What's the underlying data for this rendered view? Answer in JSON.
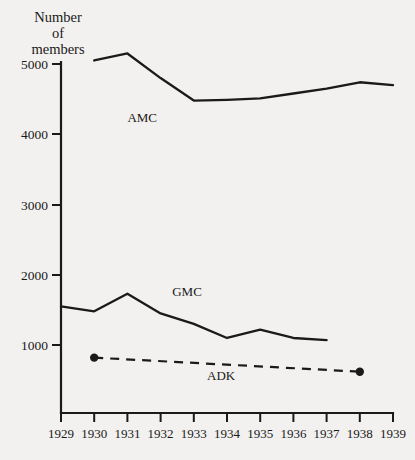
{
  "chart_data": {
    "type": "line",
    "title": "",
    "ylabel": "Number of members",
    "ylabel_lines": [
      "Number",
      "of",
      "members"
    ],
    "xlabel": "",
    "x": [
      1929,
      1930,
      1931,
      1932,
      1933,
      1934,
      1935,
      1936,
      1937,
      1938,
      1939
    ],
    "xtick_labels": [
      "1929",
      "1930",
      "1931",
      "1932",
      "1933",
      "1934",
      "1935",
      "1936",
      "1937",
      "1938",
      "1939"
    ],
    "ytick_labels": [
      "1000",
      "2000",
      "3000",
      "4000",
      "5000"
    ],
    "yticks": [
      1000,
      2000,
      3000,
      4000,
      5000
    ],
    "xlim": [
      1929,
      1939
    ],
    "ylim": [
      0,
      5000
    ],
    "grid": false,
    "legend_position": "inline-labels",
    "series": [
      {
        "name": "AMC",
        "label": "AMC",
        "style": "solid",
        "markers": false,
        "x": [
          1930,
          1931,
          1932,
          1933,
          1934,
          1935,
          1936,
          1937,
          1938,
          1939
        ],
        "values": [
          5050,
          5150,
          4800,
          4480,
          4490,
          4510,
          4580,
          4650,
          4740,
          4700
        ]
      },
      {
        "name": "GMC",
        "label": "GMC",
        "style": "solid",
        "markers": false,
        "x": [
          1929,
          1930,
          1931,
          1932,
          1933,
          1934,
          1935,
          1936,
          1937
        ],
        "values": [
          1550,
          1480,
          1730,
          1450,
          1300,
          1100,
          1220,
          1100,
          1070
        ]
      },
      {
        "name": "ADK",
        "label": "ADK",
        "style": "dashed",
        "markers": true,
        "x": [
          1930,
          1938
        ],
        "values": [
          820,
          620
        ]
      }
    ],
    "annotations": [
      {
        "text": "AMC",
        "x": 1931.0,
        "y": 4170
      },
      {
        "text": "GMC",
        "x": 1932.35,
        "y": 1700
      },
      {
        "text": "ADK",
        "x": 1933.4,
        "y": 500
      }
    ],
    "colors": {
      "background": "#f2f1ef",
      "ink": "#1a1a1a"
    }
  }
}
